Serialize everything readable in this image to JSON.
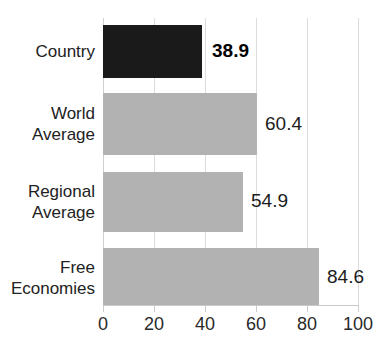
{
  "chart_data": {
    "type": "bar",
    "orientation": "horizontal",
    "title": "",
    "xlabel": "",
    "ylabel": "",
    "xlim": [
      0,
      100
    ],
    "grid": true,
    "legend": false,
    "categories": [
      "Country",
      "World Average",
      "Regional Average",
      "Free Economies"
    ],
    "values": [
      38.9,
      60.4,
      54.9,
      84.6
    ],
    "value_labels": [
      "38.9",
      "60.4",
      "54.9",
      "84.6"
    ],
    "xticks": [
      0,
      20,
      40,
      60,
      80,
      100
    ],
    "xtick_labels": [
      "0",
      "20",
      "40",
      "60",
      "80",
      "100"
    ],
    "series": [
      {
        "name": "Score",
        "values": [
          38.9,
          60.4,
          54.9,
          84.6
        ]
      }
    ],
    "bars": [
      {
        "category": "Country",
        "category_lines": [
          "Country"
        ],
        "value": 38.9,
        "value_label": "38.9",
        "color": "#1a1a1a",
        "emphasis": true
      },
      {
        "category": "World Average",
        "category_lines": [
          "World",
          "Average"
        ],
        "value": 60.4,
        "value_label": "60.4",
        "color": "#b2b2b2",
        "emphasis": false
      },
      {
        "category": "Regional Average",
        "category_lines": [
          "Regional",
          "Average"
        ],
        "value": 54.9,
        "value_label": "54.9",
        "color": "#b2b2b2",
        "emphasis": false
      },
      {
        "category": "Free Economies",
        "category_lines": [
          "Free",
          "Economies"
        ],
        "value": 84.6,
        "value_label": "84.6",
        "color": "#b2b2b2",
        "emphasis": false
      }
    ],
    "colors": {
      "highlight_bar": "#1a1a1a",
      "default_bar": "#b2b2b2",
      "gridline": "#dcdcdc",
      "axis": "#c9c9c9",
      "text": "#222222",
      "background": "#ffffff"
    }
  },
  "labels": {
    "cat_0": "Country",
    "cat_1": "World\nAverage",
    "cat_2": "Regional\nAverage",
    "cat_3": "Free\nEconomies",
    "val_0": "38.9",
    "val_1": "60.4",
    "val_2": "54.9",
    "val_3": "84.6",
    "tick_0": "0",
    "tick_1": "20",
    "tick_2": "40",
    "tick_3": "60",
    "tick_4": "80",
    "tick_5": "100"
  }
}
